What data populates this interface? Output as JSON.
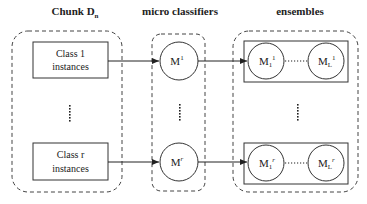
{
  "headers": {
    "chunk": "Chunk D",
    "chunk_sub": "n",
    "micro": "micro classifiers",
    "ensembles": "ensembles"
  },
  "chunk_items": [
    {
      "line1": "Class 1",
      "line2": "instances"
    },
    {
      "line1": "Class r",
      "line2": "instances"
    }
  ],
  "micro_classifiers": [
    {
      "label": "M",
      "sup": "1"
    },
    {
      "label": "M",
      "sup": "r"
    }
  ],
  "ensembles": [
    {
      "first": {
        "label": "M",
        "sub": "1",
        "sup": "1"
      },
      "last": {
        "label": "M",
        "sub": "L",
        "sup": "1"
      }
    },
    {
      "first": {
        "label": "M",
        "sub": "1",
        "sup": "r"
      },
      "last": {
        "label": "M",
        "sub": "L",
        "sup": "r"
      }
    }
  ],
  "colors": {
    "stroke": "#333333",
    "dash": "#444444"
  }
}
